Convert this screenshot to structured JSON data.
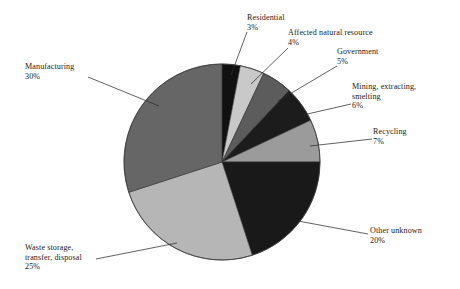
{
  "chart_data": {
    "type": "pie",
    "title": "",
    "subtitle": "",
    "xlabel": "",
    "ylabel": "",
    "legend_position": "callout-labels",
    "grid": false,
    "units": "percent",
    "total": 100,
    "start_angle_deg": 0,
    "direction": "clockwise",
    "categories": [
      "Residential",
      "Affected natural resource",
      "Government",
      "Mining, extracting, smelting",
      "Recycling",
      "Other unknown",
      "Waste storage, transfer, disposal",
      "Manufacturing"
    ],
    "values": [
      3,
      4,
      5,
      6,
      7,
      20,
      25,
      30
    ],
    "colors": [
      "#111111",
      "#c9c9c9",
      "#5c5c5c",
      "#1c1c1c",
      "#9b9b9b",
      "#191919",
      "#b6b6b6",
      "#666666"
    ],
    "slices": [
      {
        "label": "Residential",
        "value": 3,
        "percent_text": "3%",
        "color": "#111111"
      },
      {
        "label": "Affected natural resource",
        "value": 4,
        "percent_text": "4%",
        "color": "#c9c9c9"
      },
      {
        "label": "Government",
        "value": 5,
        "percent_text": "5%",
        "color": "#5c5c5c"
      },
      {
        "label": "Mining, extracting, smelting",
        "value": 6,
        "percent_text": "6%",
        "color": "#1c1c1c"
      },
      {
        "label": "Recycling",
        "value": 7,
        "percent_text": "7%",
        "color": "#9b9b9b"
      },
      {
        "label": "Other unknown",
        "value": 20,
        "percent_text": "20%",
        "color": "#191919"
      },
      {
        "label": "Waste storage, transfer, disposal",
        "value": 25,
        "percent_text": "25%",
        "color": "#b6b6b6"
      },
      {
        "label": "Manufacturing",
        "value": 30,
        "percent_text": "30%",
        "color": "#666666"
      }
    ]
  },
  "labels": {
    "residential": {
      "line1": "Residential",
      "pct": "3%"
    },
    "affected": {
      "line1": "Affected natural resource",
      "pct": "4%"
    },
    "government": {
      "line1": "Government",
      "pct": "5%"
    },
    "mining": {
      "line1": "Mining, extracting,",
      "line2": "smelting",
      "pct": "6%"
    },
    "recycling": {
      "line1": "Recycling",
      "pct": "7%"
    },
    "other": {
      "line1": "Other unknown",
      "pct": "20%"
    },
    "waste": {
      "line1": "Waste storage,",
      "line2": "transfer, disposal",
      "pct": "25%"
    },
    "manufacturing": {
      "line1": "Manufacturing",
      "pct": "30%"
    }
  },
  "style": {
    "background": "#ffffff",
    "leader_line_color": "#2b2b2b",
    "pie_outline_color": "#3a3a3a"
  }
}
